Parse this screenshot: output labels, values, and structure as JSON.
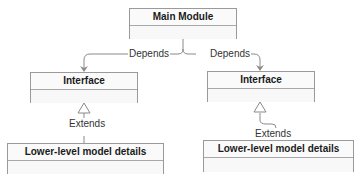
{
  "diagram": {
    "nodes": {
      "main": {
        "title": "Main Module"
      },
      "iface_left": {
        "title": "Interface"
      },
      "iface_right": {
        "title": "Interface"
      },
      "lower_left": {
        "title": "Lower-level model details"
      },
      "lower_right": {
        "title": "Lower-level model details"
      }
    },
    "edges": {
      "depends_left": {
        "label": "Depends",
        "from": "Main Module",
        "to": "Interface"
      },
      "depends_right": {
        "label": "Depends",
        "from": "Main Module",
        "to": "Interface"
      },
      "extends_left": {
        "label": "Extends",
        "from": "Lower-level model details",
        "to": "Interface"
      },
      "extends_right": {
        "label": "Extends",
        "from": "Lower-level model details",
        "to": "Interface"
      }
    },
    "colors": {
      "line": "#8a8a8a",
      "border": "#9a9a9a",
      "text": "#1a1a1a"
    }
  }
}
